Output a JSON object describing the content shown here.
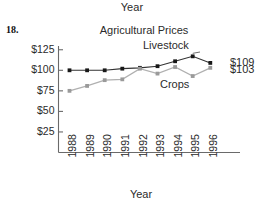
{
  "figure": {
    "item_number": "18.",
    "stray_top_label": "Year"
  },
  "chart_data": {
    "type": "line",
    "title": "Agricultural Prices",
    "xlabel": "Year",
    "ylabel": "",
    "categories": [
      "1988",
      "1989",
      "1990",
      "1991",
      "1992",
      "1993",
      "1994",
      "1995",
      "1996"
    ],
    "ylim": [
      0,
      130
    ],
    "yticks": [
      "$25",
      "$50",
      "$75",
      "$100",
      "$125"
    ],
    "ytick_values": [
      25,
      50,
      75,
      100,
      125
    ],
    "grid": false,
    "legend": "inline-annotations",
    "series": [
      {
        "name": "Livestock",
        "color": "#333333",
        "values": [
          100,
          100,
          100,
          102,
          103,
          105,
          111,
          117,
          109
        ],
        "end_label": "$109"
      },
      {
        "name": "Crops",
        "color": "#b0b0b0",
        "values": [
          75,
          81,
          88,
          89,
          102,
          96,
          104,
          93,
          103
        ],
        "end_label": "$103"
      }
    ],
    "annotations": [
      {
        "text": "Livestock",
        "series": "Livestock"
      },
      {
        "text": "Crops",
        "series": "Crops"
      },
      {
        "text": "$109",
        "series": "Livestock"
      },
      {
        "text": "$103",
        "series": "Crops"
      }
    ]
  }
}
